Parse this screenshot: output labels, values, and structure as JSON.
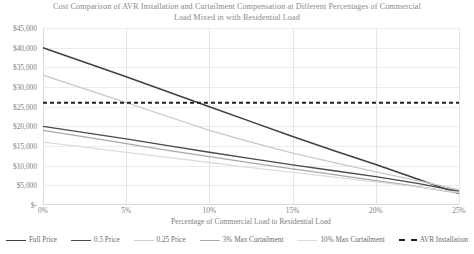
{
  "chart_data": {
    "type": "line",
    "title": "Cost Comparison of AVR Installation and Curtailment Compensation at Different Percentages of Commercial Load Mixed in with Residential Load",
    "xlabel": "Percentage of Commercial Load to Residential Load",
    "ylabel": "",
    "xticks": [
      "0%",
      "5%",
      "10%",
      "15%",
      "20%",
      "25%"
    ],
    "xtick_values": [
      0,
      5,
      10,
      15,
      20,
      25
    ],
    "yticks": [
      "$-",
      "$5,000",
      "$10,000",
      "$15,000",
      "$20,000",
      "$25,000",
      "$30,000",
      "$35,000",
      "$40,000",
      "$45,000"
    ],
    "ytick_values": [
      0,
      5000,
      10000,
      15000,
      20000,
      25000,
      30000,
      35000,
      40000,
      45000
    ],
    "xlim": [
      0,
      25
    ],
    "ylim": [
      0,
      45000
    ],
    "grid": true,
    "legend_position": "bottom",
    "x": [
      0,
      2.5,
      5,
      7.5,
      10,
      12.5,
      15,
      17.5,
      20,
      22.5,
      25
    ],
    "series": [
      {
        "name": "Full Price",
        "color": "#3f3f3f",
        "width": 1.5,
        "dash": "none",
        "values": [
          40000,
          36300,
          32600,
          28800,
          25000,
          21200,
          17400,
          13800,
          10300,
          6600,
          2900
        ]
      },
      {
        "name": "0.5 Price",
        "color": "#4a4a4a",
        "width": 1.4,
        "dash": "none",
        "values": [
          20000,
          18400,
          16800,
          15100,
          13400,
          11800,
          10200,
          8700,
          7200,
          5500,
          3500
        ]
      },
      {
        "name": "0.25 Price",
        "color": "#c9c9c9",
        "width": 1.3,
        "dash": "none",
        "values": [
          33000,
          29500,
          26000,
          22500,
          19000,
          16000,
          13200,
          10800,
          8400,
          6200,
          3900
        ]
      },
      {
        "name": "3% Max Curtailment",
        "color": "#a8a8a8",
        "width": 1.3,
        "dash": "none",
        "values": [
          19000,
          17300,
          15600,
          13900,
          12300,
          10700,
          9200,
          7700,
          6200,
          4700,
          3000
        ]
      },
      {
        "name": "10% Max Curtailment",
        "color": "#dcdcdc",
        "width": 1.3,
        "dash": "none",
        "values": [
          16000,
          14700,
          13400,
          12100,
          10800,
          9500,
          8300,
          7100,
          5900,
          4600,
          3200
        ]
      },
      {
        "name": "AVR Installation",
        "color": "#1f1f1f",
        "width": 2.1,
        "dash": "4 3",
        "values": [
          26000,
          26000,
          26000,
          26000,
          26000,
          26000,
          26000,
          26000,
          26000,
          26000,
          26000
        ]
      }
    ]
  },
  "legend": {
    "items": [
      {
        "label": "Full Price",
        "color": "#3f3f3f",
        "dashed": false
      },
      {
        "label": "0.5 Price",
        "color": "#4a4a4a",
        "dashed": false
      },
      {
        "label": "0.25 Price",
        "color": "#cfcfcf",
        "dashed": false
      },
      {
        "label": "3% Max Curtailment",
        "color": "#ababab",
        "dashed": false
      },
      {
        "label": "10% Max Curtailment",
        "color": "#dcdcdc",
        "dashed": false
      },
      {
        "label": "AVR Installation",
        "color": "#1f1f1f",
        "dashed": true
      }
    ]
  }
}
